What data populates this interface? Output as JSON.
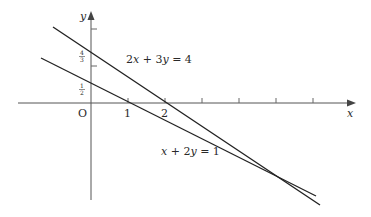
{
  "diagram": {
    "axes": {
      "x_label": "x",
      "y_label": "y",
      "origin_label": "O",
      "x_tick_labels": [
        "1",
        "2"
      ],
      "y_tick_labels": [
        {
          "num": "1",
          "den": "2"
        },
        {
          "num": "4",
          "den": "3"
        }
      ]
    },
    "lines": [
      {
        "equation": "2x + 3y = 4",
        "label_parts": [
          "2",
          "x",
          " + 3",
          "y",
          " = 4"
        ]
      },
      {
        "equation": "x + 2y = 1",
        "label_parts": [
          "",
          "x",
          " + 2",
          "y",
          " = 1"
        ]
      }
    ],
    "intersection": {
      "x": 5,
      "y": -2
    },
    "colors": {
      "line": "#222222",
      "axis": "#555555"
    }
  }
}
